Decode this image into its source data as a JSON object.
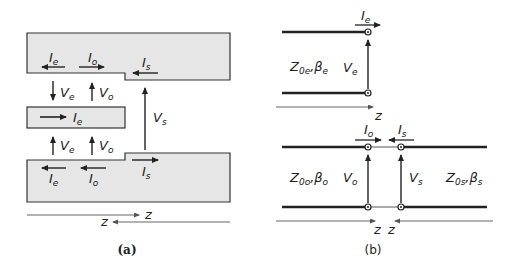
{
  "figure_a": {
    "caption": "(a)",
    "top_conductor": {
      "labels": [
        {
          "main": "I",
          "sub": "e",
          "direction": "left"
        },
        {
          "main": "I",
          "sub": "o",
          "direction": "right"
        },
        {
          "main": "I",
          "sub": "s",
          "direction": "left"
        }
      ]
    },
    "middle_strip": {
      "label": {
        "main": "I",
        "sub": "e",
        "direction": "right"
      }
    },
    "bottom_conductor": {
      "labels": [
        {
          "main": "I",
          "sub": "e",
          "direction": "left"
        },
        {
          "main": "I",
          "sub": "o",
          "direction": "left"
        },
        {
          "main": "I",
          "sub": "s",
          "direction": "right"
        }
      ]
    },
    "voltages": {
      "upper": [
        {
          "main": "V",
          "sub": "e",
          "direction": "down"
        },
        {
          "main": "V",
          "sub": "o",
          "direction": "up"
        }
      ],
      "lower": [
        {
          "main": "V",
          "sub": "e",
          "direction": "up"
        },
        {
          "main": "V",
          "sub": "o",
          "direction": "up"
        }
      ],
      "vs": {
        "main": "V",
        "sub": "s",
        "direction": "up"
      }
    },
    "axes": [
      {
        "label": "z",
        "direction": "right"
      },
      {
        "label": "z",
        "direction": "left"
      }
    ]
  },
  "figure_b": {
    "caption": "(b)",
    "even_line": {
      "impedance": {
        "main": "Z",
        "sub": "0e",
        "sep": ",",
        "beta": "β",
        "beta_sub": "e"
      },
      "current": {
        "main": "I",
        "sub": "e"
      },
      "voltage": {
        "main": "V",
        "sub": "e"
      },
      "axis": "z"
    },
    "odd_sum_line": {
      "impedance_left": {
        "main": "Z",
        "sub": "0o",
        "sep": ",",
        "beta": "β",
        "beta_sub": "o"
      },
      "impedance_right": {
        "main": "Z",
        "sub": "0s",
        "sep": ",",
        "beta": "β",
        "beta_sub": "s"
      },
      "currents": [
        {
          "main": "I",
          "sub": "o"
        },
        {
          "main": "I",
          "sub": "s"
        }
      ],
      "voltages": [
        {
          "main": "V",
          "sub": "o"
        },
        {
          "main": "V",
          "sub": "s"
        }
      ],
      "axes": [
        "z",
        "z"
      ]
    }
  },
  "colors": {
    "conductor_fill": "#e6e6e6",
    "stroke": "#222222",
    "axis": "#555555"
  }
}
